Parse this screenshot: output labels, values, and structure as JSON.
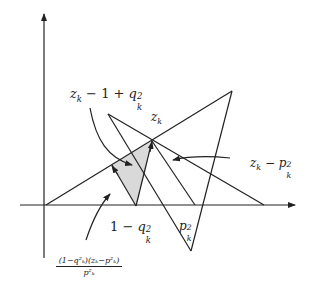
{
  "figure": {
    "type": "geometric-diagram",
    "colors": {
      "line": "#222222",
      "shade": "#d9d9d9",
      "background": "#ffffff"
    },
    "labels": {
      "top_left": {
        "base": "z",
        "sub": "k",
        "rest": " − 1 + ",
        "q": "q",
        "q_sup": "2",
        "q_sub": "k"
      },
      "center": {
        "base": "z",
        "sub": "k"
      },
      "right": {
        "base": "z",
        "sub": "k",
        "rest": " − ",
        "p": "p",
        "p_sup": "2",
        "p_sub": "k"
      },
      "bottom_mid": {
        "one": "1 − ",
        "q": "q",
        "q_sup": "2",
        "q_sub": "k"
      },
      "bottom_right": {
        "p": "p",
        "p_sup": "2",
        "p_sub": "k"
      },
      "formula": {
        "numerator": "(1−q²ₖ)(zₖ−p²ₖ)",
        "denominator": "p²ₖ"
      }
    }
  }
}
